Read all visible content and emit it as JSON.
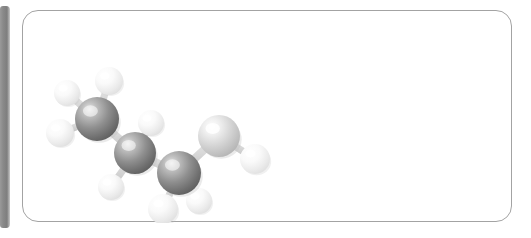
{
  "canvas": {
    "width": 531,
    "height": 238,
    "background": "#ffffff"
  },
  "left_bar": {
    "name": "spine-bar",
    "color": "#858585",
    "x": 0,
    "y": 6,
    "width": 10,
    "height": 222
  },
  "panel": {
    "name": "figure-panel",
    "background": "#ffffff",
    "border_color": "#a3a3a3",
    "border_radius": 16,
    "x": 22,
    "y": 10,
    "width": 490,
    "height": 212
  },
  "figure": {
    "name": "molecule-ball-and-stick",
    "kind": "3d-space-filling-ball-and-stick",
    "carbon_color": "#8e8e8e",
    "carbon_color_light": "#d8d8d8",
    "hydrogen_color": "#f0f0f0",
    "bond_color": "#d6d6d6",
    "atoms": [
      {
        "id": "C1",
        "element": "C",
        "label": "carbon-1",
        "cx": 74,
        "cy": 108,
        "r": 22,
        "shade": "dark"
      },
      {
        "id": "C2",
        "element": "C",
        "label": "carbon-2",
        "cx": 112,
        "cy": 142,
        "r": 21,
        "shade": "dark"
      },
      {
        "id": "C3",
        "element": "C",
        "label": "carbon-3",
        "cx": 156,
        "cy": 162,
        "r": 22,
        "shade": "dark"
      },
      {
        "id": "C4",
        "element": "C",
        "label": "carbon-4",
        "cx": 196,
        "cy": 125,
        "r": 21,
        "shade": "light"
      },
      {
        "id": "H1",
        "element": "H",
        "label": "hydrogen-1",
        "cx": 44,
        "cy": 82,
        "r": 13,
        "shade": "white"
      },
      {
        "id": "H2",
        "element": "H",
        "label": "hydrogen-2",
        "cx": 37,
        "cy": 122,
        "r": 14,
        "shade": "white"
      },
      {
        "id": "H3",
        "element": "H",
        "label": "hydrogen-3",
        "cx": 86,
        "cy": 70,
        "r": 14,
        "shade": "white"
      },
      {
        "id": "H4",
        "element": "H",
        "label": "hydrogen-4",
        "cx": 128,
        "cy": 112,
        "r": 13,
        "shade": "white"
      },
      {
        "id": "H5",
        "element": "H",
        "label": "hydrogen-5",
        "cx": 88,
        "cy": 176,
        "r": 13,
        "shade": "white"
      },
      {
        "id": "H6",
        "element": "H",
        "label": "hydrogen-6",
        "cx": 140,
        "cy": 198,
        "r": 15,
        "shade": "white"
      },
      {
        "id": "H7",
        "element": "H",
        "label": "hydrogen-7",
        "cx": 176,
        "cy": 190,
        "r": 13,
        "shade": "white"
      },
      {
        "id": "H8",
        "element": "H",
        "label": "hydrogen-8",
        "cx": 232,
        "cy": 148,
        "r": 15,
        "shade": "white"
      }
    ],
    "bonds": [
      {
        "from": "C1",
        "to": "C2",
        "label": "bond-c1-c2"
      },
      {
        "from": "C2",
        "to": "C3",
        "label": "bond-c2-c3"
      },
      {
        "from": "C3",
        "to": "C4",
        "label": "bond-c3-c4"
      },
      {
        "from": "C1",
        "to": "H1",
        "label": "bond-c1-h1"
      },
      {
        "from": "C1",
        "to": "H2",
        "label": "bond-c1-h2"
      },
      {
        "from": "C1",
        "to": "H3",
        "label": "bond-c1-h3"
      },
      {
        "from": "C2",
        "to": "H4",
        "label": "bond-c2-h4"
      },
      {
        "from": "C2",
        "to": "H5",
        "label": "bond-c2-h5"
      },
      {
        "from": "C3",
        "to": "H6",
        "label": "bond-c3-h6"
      },
      {
        "from": "C3",
        "to": "H7",
        "label": "bond-c3-h7"
      },
      {
        "from": "C4",
        "to": "H8",
        "label": "bond-c4-h8"
      }
    ]
  }
}
